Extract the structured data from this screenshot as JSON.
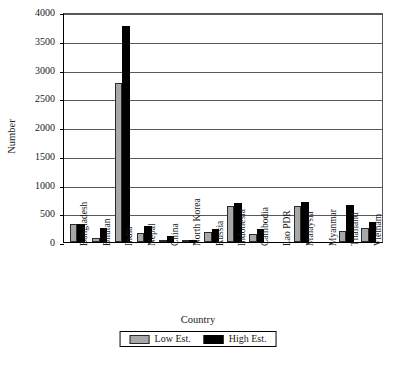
{
  "chart_data": {
    "type": "bar",
    "title": "",
    "xlabel": "Country",
    "ylabel": "Number",
    "ylim": [
      0,
      4000
    ],
    "yticks": [
      0,
      500,
      1000,
      1500,
      2000,
      2500,
      3000,
      3500,
      4000
    ],
    "ytick_labels": [
      "0",
      "500",
      "1000",
      "1500",
      "2000",
      "2500",
      "3000",
      "3500",
      "4000"
    ],
    "grid": "horizontal",
    "legend_position": "bottom-center",
    "categories": [
      "Bangladesh",
      "Bhutan",
      "India",
      "Nepal",
      "China",
      "North Korea",
      "Russia",
      "Indonesia",
      "Cambodia",
      "Lao PDR",
      "Malaysia",
      "Myanmar",
      "Thailand",
      "Vietnam"
    ],
    "series": [
      {
        "name": "Low Est.",
        "color": "#a8a8a8",
        "values": [
          310,
          70,
          2770,
          165,
          40,
          20,
          175,
          620,
          135,
          0,
          625,
          0,
          200,
          250
        ]
      },
      {
        "name": "High Est.",
        "color": "#000000",
        "values": [
          315,
          250,
          3750,
          275,
          100,
          25,
          230,
          670,
          235,
          0,
          690,
          0,
          640,
          355
        ]
      }
    ]
  },
  "legend": {
    "items": [
      {
        "label": "Low Est.",
        "swatch": "grey-swatch"
      },
      {
        "label": "High Est.",
        "swatch": "black-swatch"
      }
    ]
  }
}
